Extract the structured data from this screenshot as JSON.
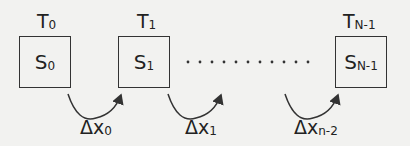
{
  "states": [
    {
      "time_label": "T",
      "time_sub": "0",
      "state_label": "S",
      "state_sub": "0"
    },
    {
      "time_label": "T",
      "time_sub": "1",
      "state_label": "S",
      "state_sub": "1"
    },
    {
      "time_label": "T",
      "time_sub": "N-1",
      "state_label": "S",
      "state_sub": "N-1"
    }
  ],
  "transitions": [
    {
      "label": "Δx",
      "sub": "0"
    },
    {
      "label": "Δx",
      "sub": "1"
    },
    {
      "label": "Δx",
      "sub": "n-2"
    }
  ],
  "ellipsis": "· · · · · · · · · · ·"
}
